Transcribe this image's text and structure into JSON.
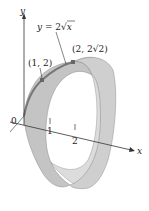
{
  "figure": {
    "type": "surface-of-revolution",
    "curve_label": "y = 2√x",
    "curve_label_parts": {
      "lhs": "y",
      "eq": " = 2",
      "radical": "√",
      "var": "x"
    },
    "axis_labels": {
      "x": "x",
      "y": "y",
      "origin": "0"
    },
    "ticks": [
      {
        "value": "1"
      },
      {
        "value": "2"
      }
    ],
    "points": [
      {
        "label": "(1, 2)"
      },
      {
        "label": "(2, 2√2)"
      }
    ],
    "colors": {
      "surface_outer": "#c9c9c9",
      "surface_inner": "#dcdcdc",
      "curve": "#777777",
      "point": "#666666",
      "axis": "#333333"
    }
  }
}
